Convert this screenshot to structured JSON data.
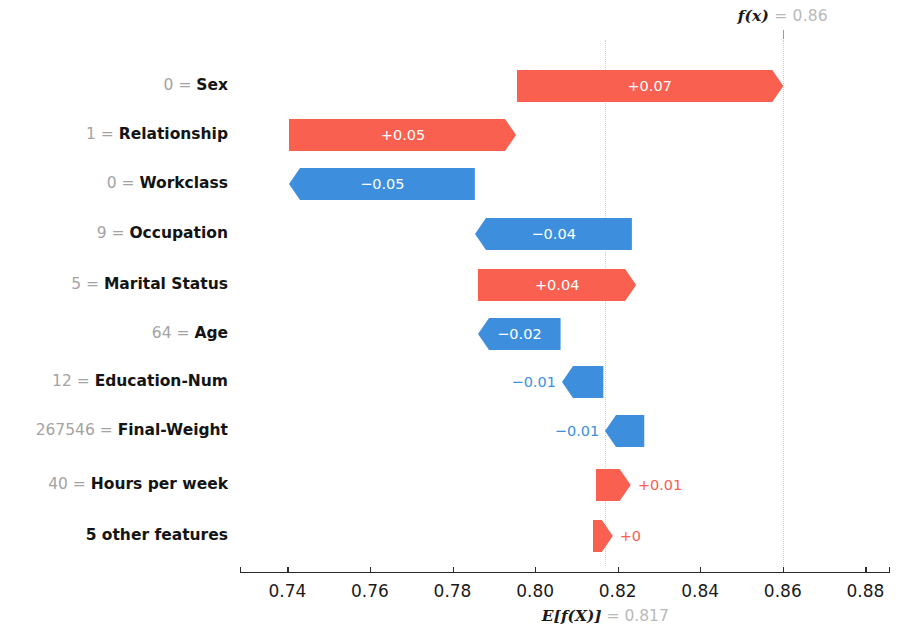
{
  "chart_data": {
    "type": "bar",
    "chart_variant": "shap-waterfall",
    "title": "",
    "xlabel": "",
    "ylabel": "",
    "xlim": [
      0.7284,
      0.8856
    ],
    "grid": false,
    "legend": null,
    "base_value": 0.817,
    "base_value_label": "E[f(X)]",
    "base_value_text": "0.817",
    "output_value": 0.86,
    "output_value_label": "f(x)",
    "output_value_text": "0.86",
    "xticks": [
      0.74,
      0.76,
      0.78,
      0.8,
      0.82,
      0.84,
      0.86,
      0.88
    ],
    "xticklabels": [
      "0.74",
      "0.76",
      "0.78",
      "0.80",
      "0.82",
      "0.84",
      "0.86",
      "0.88"
    ],
    "colors": {
      "positive": "#F9604F",
      "negative": "#3D8FDE",
      "positive_text": "#F9604F",
      "negative_text": "#3D8FDE",
      "inside_text": "#ffffff",
      "value_prefix_text": "#a3a3a3",
      "feature_name_text": "#141414",
      "axis": "#2b2b2b",
      "annotation_value": "#b9b9b9"
    },
    "categories": [
      "0 = Sex",
      "1 = Relationship",
      "0 = Workclass",
      "9 = Occupation",
      "5 = Marital Status",
      "64 = Age",
      "12 = Education-Num",
      "267546 = Final-Weight",
      "40 = Hours per week",
      "5 other features"
    ],
    "values": [
      0.07,
      0.05,
      -0.05,
      -0.04,
      0.04,
      -0.02,
      -0.01,
      -0.01,
      0.01,
      0.0
    ],
    "value_labels": [
      "+0.07",
      "+0.05",
      "−0.05",
      "−0.04",
      "+0.04",
      "−0.02",
      "−0.01",
      "−0.01",
      "+0.01",
      "+0"
    ]
  },
  "rows": [
    {
      "feature_value": "0",
      "equals": "=",
      "feature_name": "Sex",
      "value_label": "+0.07",
      "value": 0.07,
      "direction": "positive",
      "label_placement": "inside",
      "x_start": 0.7955,
      "x_end": 0.86,
      "y": 86
    },
    {
      "feature_value": "1",
      "equals": "=",
      "feature_name": "Relationship",
      "value_label": "+0.05",
      "value": 0.05,
      "direction": "positive",
      "label_placement": "inside",
      "x_start": 0.7405,
      "x_end": 0.7955,
      "y": 135
    },
    {
      "feature_value": "0",
      "equals": "=",
      "feature_name": "Workclass",
      "value_label": "−0.05",
      "value": -0.05,
      "direction": "negative",
      "label_placement": "inside",
      "x_start": 0.7405,
      "x_end": 0.7855,
      "y": 184
    },
    {
      "feature_value": "9",
      "equals": "=",
      "feature_name": "Occupation",
      "value_label": "−0.04",
      "value": -0.04,
      "direction": "negative",
      "label_placement": "inside",
      "x_start": 0.7855,
      "x_end": 0.8235,
      "y": 234
    },
    {
      "feature_value": "5",
      "equals": "=",
      "feature_name": "Marital Status",
      "value_label": "+0.04",
      "value": 0.04,
      "direction": "positive",
      "label_placement": "inside",
      "x_start": 0.7862,
      "x_end": 0.8245,
      "y": 285
    },
    {
      "feature_value": "64",
      "equals": "=",
      "feature_name": "Age",
      "value_label": "−0.02",
      "value": -0.02,
      "direction": "negative",
      "label_placement": "inside",
      "x_start": 0.7862,
      "x_end": 0.8062,
      "y": 334
    },
    {
      "feature_value": "12",
      "equals": "=",
      "feature_name": "Education-Num",
      "value_label": "−0.01",
      "value": -0.01,
      "direction": "negative",
      "label_placement": "outside-left",
      "x_start": 0.8065,
      "x_end": 0.8165,
      "y": 382
    },
    {
      "feature_value": "267546",
      "equals": "=",
      "feature_name": "Final-Weight",
      "value_label": "−0.01",
      "value": -0.01,
      "direction": "negative",
      "label_placement": "outside-left",
      "x_start": 0.817,
      "x_end": 0.8265,
      "y": 431
    },
    {
      "feature_value": "40",
      "equals": "=",
      "feature_name": "Hours per week",
      "value_label": "+0.01",
      "value": 0.01,
      "direction": "positive",
      "label_placement": "outside-right",
      "x_start": 0.8148,
      "x_end": 0.8232,
      "y": 485
    },
    {
      "feature_value": "5 other features",
      "equals": "",
      "feature_name": "",
      "value_label": "+0",
      "value": 0.0,
      "direction": "positive",
      "label_placement": "outside-right",
      "x_start": 0.814,
      "x_end": 0.8188,
      "y": 536
    }
  ],
  "annotations": {
    "top": {
      "symbol": "f(x)",
      "equals": "=",
      "value": "0.86"
    },
    "bottom": {
      "symbol": "E[f(X)]",
      "equals": "=",
      "value": "0.817"
    }
  }
}
